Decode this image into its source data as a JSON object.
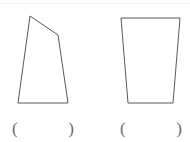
{
  "page": {
    "background_color": "#ffffff",
    "stroke_color": "#58585a",
    "paren_color": "#6b6b6d",
    "width": 190,
    "height": 142
  },
  "figures": [
    {
      "name": "quadrilateral",
      "description": "irregular quadrilateral with slanted top edge",
      "points": "18,103 30,16 58,35 68,103",
      "answer": {
        "open_paren": "(",
        "close_paren": ")",
        "value": ""
      }
    },
    {
      "name": "trapezoid",
      "description": "trapezoid wider at the top than at the bottom",
      "points": "121,18 180,18 173,103 128,103",
      "answer": {
        "open_paren": "(",
        "close_paren": ")",
        "value": ""
      }
    }
  ]
}
